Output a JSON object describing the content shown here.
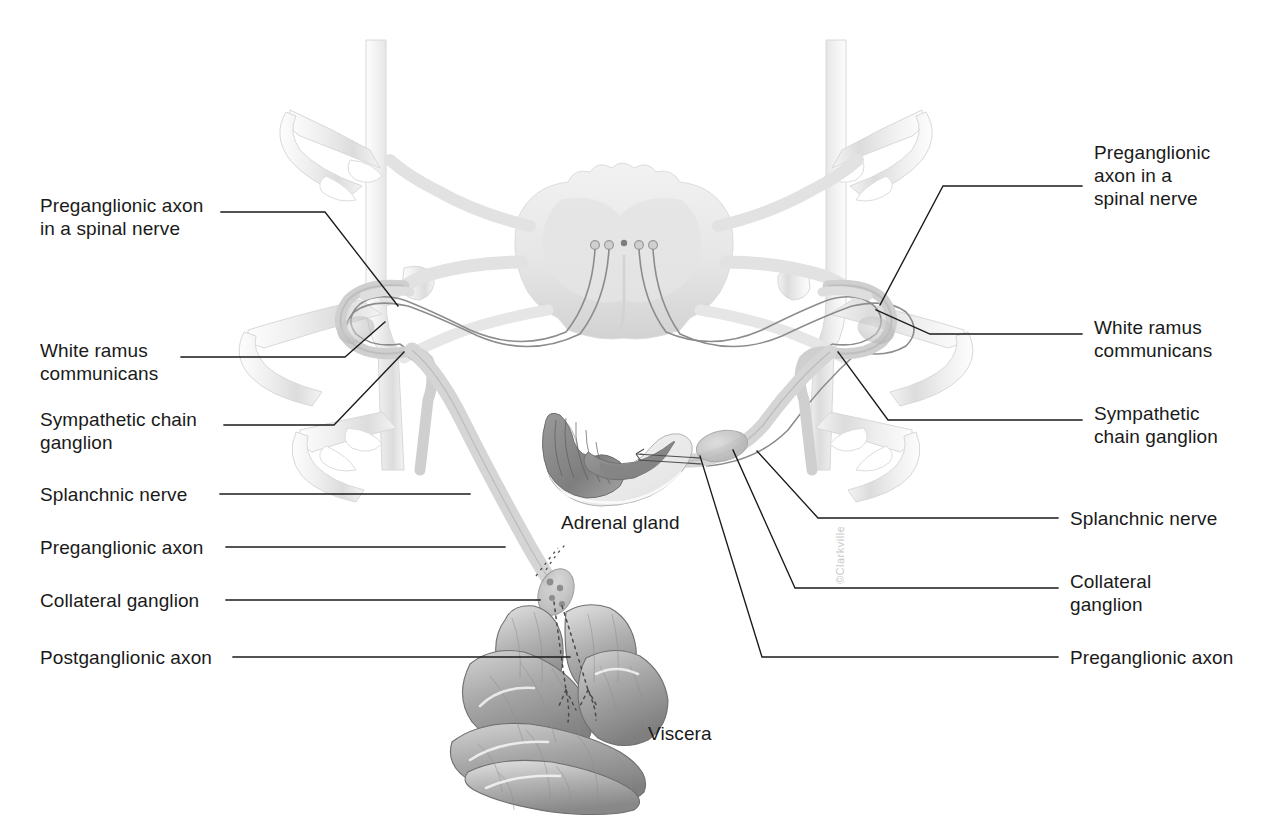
{
  "figure": {
    "background_color": "#ffffff",
    "line_color": "#1a1a1a",
    "text_color": "#1a1a1a"
  },
  "watermark": {
    "text": "©Clarkville"
  },
  "labels_left": [
    {
      "id": "preganglionic-axon-spinal-nerve-left",
      "text": "Preganglionic axon\nin a spinal nerve"
    },
    {
      "id": "white-ramus-communicans-left",
      "text": "White ramus\ncommunicans"
    },
    {
      "id": "sympathetic-chain-ganglion-left",
      "text": "Sympathetic chain\nganglion"
    },
    {
      "id": "splanchnic-nerve-left",
      "text": "Splanchnic nerve"
    },
    {
      "id": "preganglionic-axon-left",
      "text": "Preganglionic axon"
    },
    {
      "id": "collateral-ganglion-left",
      "text": "Collateral ganglion"
    },
    {
      "id": "postganglionic-axon-left",
      "text": "Postganglionic axon"
    }
  ],
  "labels_right": [
    {
      "id": "preganglionic-axon-spinal-nerve-right",
      "text": "Preganglionic\naxon in a\nspinal nerve"
    },
    {
      "id": "white-ramus-communicans-right",
      "text": "White ramus\ncommunicans"
    },
    {
      "id": "sympathetic-chain-ganglion-right",
      "text": "Sympathetic\nchain ganglion"
    },
    {
      "id": "splanchnic-nerve-right",
      "text": "Splanchnic nerve"
    },
    {
      "id": "collateral-ganglion-right",
      "text": "Collateral\nganglion"
    },
    {
      "id": "preganglionic-axon-right",
      "text": "Preganglionic axon"
    }
  ],
  "labels_center": [
    {
      "id": "adrenal-gland",
      "text": "Adrenal gland"
    },
    {
      "id": "viscera",
      "text": "Viscera"
    }
  ],
  "structures": [
    {
      "id": "spinal-cord",
      "name": "spinal cord cross section",
      "color": "#ececec"
    },
    {
      "id": "vertebra-left",
      "name": "left vertebral column",
      "color": "#f0f0f0"
    },
    {
      "id": "vertebra-right",
      "name": "right vertebral column",
      "color": "#f0f0f0"
    },
    {
      "id": "adrenal-gland-art",
      "name": "adrenal gland",
      "color": "#8e8e8e"
    },
    {
      "id": "viscera-art",
      "name": "intestinal viscera",
      "color": "#9a9a9a"
    },
    {
      "id": "sympathetic-chain-left",
      "name": "left sympathetic trunk",
      "color": "#bdbdbd"
    },
    {
      "id": "sympathetic-chain-right",
      "name": "right sympathetic trunk",
      "color": "#bdbdbd"
    },
    {
      "id": "collateral-ganglion-art",
      "name": "collateral ganglion",
      "color": "#b0b0b0"
    }
  ]
}
